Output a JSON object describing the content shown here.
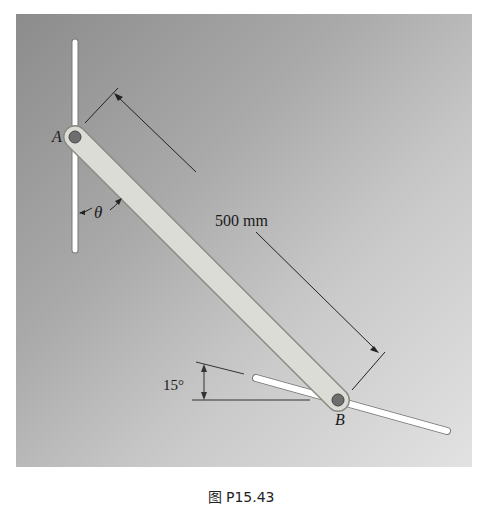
{
  "figure": {
    "labels": {
      "point_a": "A",
      "point_b": "B",
      "angle_theta": "θ",
      "length": "500 mm",
      "angle_incline": "15°"
    },
    "caption": "图 P15.43",
    "colors": {
      "background_dark": "#8c8c8c",
      "background_light": "#e2e2e2",
      "rod": "#ffffff",
      "link": "#dcdcd6",
      "pin": "#6e6e6e"
    }
  }
}
